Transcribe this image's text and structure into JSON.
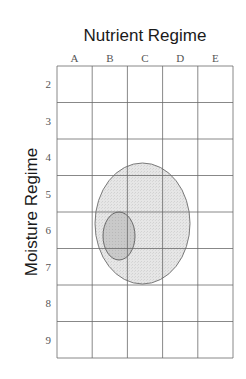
{
  "title": "Nutrient Regime",
  "y_label": "Moisture Regime",
  "columns": [
    "A",
    "B",
    "C",
    "D",
    "E"
  ],
  "rows": [
    "2",
    "3",
    "4",
    "5",
    "6",
    "7",
    "8",
    "9"
  ],
  "grid": {
    "left": 57,
    "top": 66,
    "col_width": 35.2,
    "row_height": 36.5,
    "line_color": "#6a6a6a"
  },
  "ellipses": [
    {
      "name": "large-range",
      "cx": 142.5,
      "cy": 223.5,
      "rx": 47.5,
      "ry": 60.5,
      "fill": "#e3e3e3",
      "stroke": "#7a7a7a"
    },
    {
      "name": "small-optimum",
      "cx": 119,
      "cy": 236,
      "rx": 16,
      "ry": 24,
      "fill": "#c6c6c6",
      "stroke": "#6a6a6a"
    }
  ]
}
